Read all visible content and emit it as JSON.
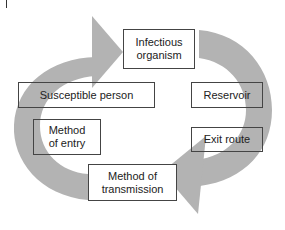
{
  "diagram": {
    "arrow_color": "#b3b3b3",
    "nodes": [
      {
        "id": "infectious-organism",
        "label": "Infectious\norganism"
      },
      {
        "id": "reservoir",
        "label": "Reservoir"
      },
      {
        "id": "exit-route",
        "label": "Exit route"
      },
      {
        "id": "method-of-transmission",
        "label": "Method of\ntransmission"
      },
      {
        "id": "method-of-entry",
        "label": "Method\nof entry"
      },
      {
        "id": "susceptible-person",
        "label": "Susceptible person"
      }
    ],
    "arrows": [
      {
        "id": "right-cycle-arrow",
        "from": "Infectious organism",
        "to": "Method of transmission",
        "direction": "clockwise"
      },
      {
        "id": "left-cycle-arrow",
        "from": "Method of transmission",
        "to": "Infectious organism",
        "direction": "clockwise"
      }
    ]
  }
}
